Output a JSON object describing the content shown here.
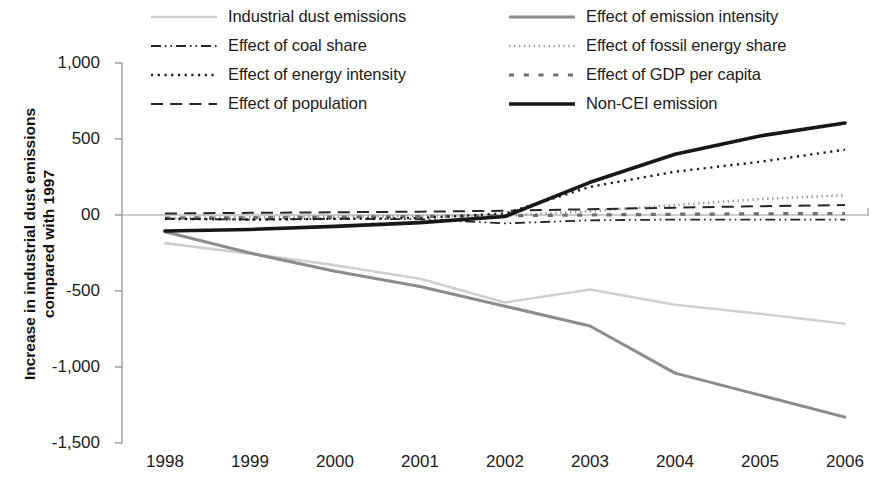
{
  "chart_data": {
    "type": "line",
    "title": "",
    "xlabel": "",
    "ylabel": "Increase in industrial dust emissions compared with 1997",
    "x": [
      "1998",
      "1999",
      "2000",
      "2001",
      "2002",
      "2003",
      "2004",
      "2005",
      "2006"
    ],
    "xlim": [
      1998,
      2006
    ],
    "ylim": [
      -1500,
      1000
    ],
    "yticks": [
      "1,000",
      "500",
      "00",
      "-500",
      "-1,000",
      "-1,500"
    ],
    "ytick_values": [
      1000,
      500,
      0,
      -500,
      -1000,
      -1500
    ],
    "grid": false,
    "legend_position": "top",
    "series": [
      {
        "name": "Industrial dust emissions",
        "style": "solid",
        "color": "#cfcfcf",
        "width": 2.6,
        "values": [
          -185,
          -255,
          -330,
          -420,
          -575,
          -490,
          -590,
          -650,
          -715
        ]
      },
      {
        "name": "Effect of emission intensity",
        "style": "solid",
        "color": "#8c8c8c",
        "width": 3.0,
        "values": [
          -110,
          -250,
          -370,
          -470,
          -600,
          -730,
          -1040,
          -1185,
          -1330
        ]
      },
      {
        "name": "Effect of coal share",
        "style": "dash-dot-dot",
        "color": "#242424",
        "width": 1.8,
        "values": [
          -25,
          -30,
          -25,
          -28,
          -55,
          -35,
          -30,
          -30,
          -30
        ]
      },
      {
        "name": "Effect of fossil energy share",
        "style": "dotted-gray",
        "color": "#9a9a9a",
        "width": 2.6,
        "values": [
          -20,
          -15,
          -10,
          -8,
          -5,
          25,
          65,
          105,
          130
        ]
      },
      {
        "name": "Effect of energy intensity",
        "style": "dotted",
        "color": "#1c1c1c",
        "width": 2.4,
        "values": [
          -25,
          -30,
          -25,
          -20,
          10,
          185,
          285,
          350,
          430
        ]
      },
      {
        "name": "Effect of GDP per capita",
        "style": "square-dash",
        "color": "#6e6e6e",
        "width": 3.2,
        "values": [
          -20,
          -18,
          -14,
          -10,
          -5,
          0,
          5,
          8,
          10
        ]
      },
      {
        "name": "Effect of population",
        "style": "long-dash",
        "color": "#262626",
        "width": 2.0,
        "values": [
          10,
          14,
          18,
          22,
          28,
          38,
          48,
          58,
          65
        ]
      },
      {
        "name": "Non-CEI emission",
        "style": "solid",
        "color": "#171717",
        "width": 3.6,
        "values": [
          -105,
          -95,
          -75,
          -50,
          -10,
          215,
          400,
          520,
          605
        ]
      }
    ]
  },
  "legend": {
    "items": [
      {
        "label": "Industrial dust emissions",
        "series": 0
      },
      {
        "label": "Effect of emission intensity",
        "series": 1
      },
      {
        "label": "Effect of coal share",
        "series": 2
      },
      {
        "label": "Effect of fossil energy share",
        "series": 3
      },
      {
        "label": "Effect of energy intensity",
        "series": 4
      },
      {
        "label": "Effect of GDP per capita",
        "series": 5
      },
      {
        "label": "Effect of population",
        "series": 6
      },
      {
        "label": "Non-CEI emission",
        "series": 7
      }
    ]
  }
}
